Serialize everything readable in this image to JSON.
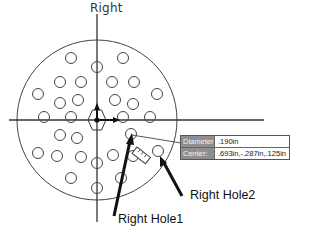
{
  "sketch": {
    "plane_label": "Right",
    "plate": {
      "cx": 97,
      "cy": 120,
      "r": 80
    },
    "axes": {
      "vertical": {
        "x": 97,
        "y1": 14,
        "y2": 222
      },
      "horizontal": {
        "y": 120,
        "x1": 9,
        "x2": 264
      }
    },
    "hole_radius": 5.5,
    "holes": [
      [
        71,
        58
      ],
      [
        123,
        58
      ],
      [
        97,
        67
      ],
      [
        60,
        82
      ],
      [
        81,
        82
      ],
      [
        112,
        82
      ],
      [
        134,
        82
      ],
      [
        38,
        94
      ],
      [
        60,
        103
      ],
      [
        78,
        100
      ],
      [
        115,
        100
      ],
      [
        133,
        104
      ],
      [
        157,
        94
      ],
      [
        44,
        117
      ],
      [
        71,
        117
      ],
      [
        123,
        117
      ],
      [
        150,
        117
      ],
      [
        60,
        135
      ],
      [
        77,
        138
      ],
      [
        38,
        153
      ],
      [
        131,
        134
      ],
      [
        57,
        156
      ],
      [
        81,
        157
      ],
      [
        113,
        155
      ],
      [
        133,
        156
      ],
      [
        97,
        163
      ],
      [
        71,
        178
      ],
      [
        121,
        178
      ],
      [
        97,
        188
      ],
      [
        158,
        151
      ]
    ],
    "colors": {
      "line": "#333333",
      "arrow": "#111111",
      "background": "#ffffff"
    }
  },
  "tooltip": {
    "diameter_label": "Diameter:",
    "diameter_value": ".190in",
    "center_label": "Center:",
    "center_value": ".693in,-.287in,.125in"
  },
  "callouts": {
    "hole1": "Right Hole1",
    "hole2": "Right Hole2"
  }
}
